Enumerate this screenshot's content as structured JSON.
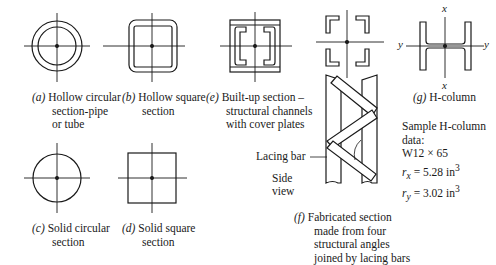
{
  "figures": [
    {
      "id": "a",
      "label": "(a)",
      "lines": [
        "Hollow circular",
        "section-pipe",
        "or tube"
      ]
    },
    {
      "id": "b",
      "label": "(b)",
      "lines": [
        "Hollow square",
        "section"
      ]
    },
    {
      "id": "e",
      "label": "(e)",
      "lines": [
        "Built-up section –",
        "structural channels",
        "with cover plates"
      ]
    },
    {
      "id": "f",
      "label": "(f)",
      "lines": [
        "Fabricated section",
        "made from four",
        "structural angles",
        "joined by lacing bars"
      ]
    },
    {
      "id": "g",
      "label": "(g)",
      "lines": [
        "H-column"
      ]
    },
    {
      "id": "c",
      "label": "(c)",
      "lines": [
        "Solid circular",
        "section"
      ]
    },
    {
      "id": "d",
      "label": "(d)",
      "lines": [
        "Solid square",
        "section"
      ]
    }
  ],
  "annotations": {
    "lacing_bar": "Lacing bar",
    "side_view_1": "Side",
    "side_view_2": "view"
  },
  "h_column_axes": {
    "x_top": "x",
    "x_bottom": "x",
    "y_left": "y",
    "y_right": "y"
  },
  "sample_data": {
    "title_1": "Sample H-column",
    "title_2": "data:",
    "designation": "W12 × 65",
    "rx_sym": "r",
    "rx_sub": "x",
    "rx_val": " = 5.28 in",
    "rx_exp": "3",
    "ry_sym": "r",
    "ry_sub": "y",
    "ry_val": " = 3.02 in",
    "ry_exp": "3"
  },
  "colors": {
    "ink": "#1a1a1a",
    "background": "#ffffff"
  }
}
